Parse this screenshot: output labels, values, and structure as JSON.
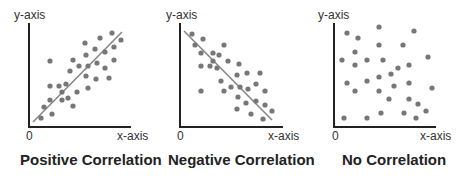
{
  "colors": {
    "axis": "#222222",
    "dot": "#777777",
    "line": "#888888",
    "text": "#222222"
  },
  "chart_data": [
    {
      "type": "scatter",
      "title": "Positive Correlation",
      "xlabel": "x-axis",
      "ylabel": "y-axis",
      "origin_label": "0",
      "trend": "positive",
      "frame": {
        "x0": 29,
        "y0": 127,
        "x1": 131,
        "ytop": 23
      },
      "trendline": [
        [
          33,
          122
        ],
        [
          122,
          32
        ]
      ],
      "points": [
        [
          50,
          61
        ],
        [
          85,
          43
        ],
        [
          100,
          38
        ],
        [
          112,
          33
        ],
        [
          121,
          40
        ],
        [
          95,
          49
        ],
        [
          86,
          55
        ],
        [
          73,
          60
        ],
        [
          79,
          66
        ],
        [
          70,
          71
        ],
        [
          88,
          66
        ],
        [
          97,
          63
        ],
        [
          105,
          52
        ],
        [
          114,
          47
        ],
        [
          105,
          68
        ],
        [
          114,
          60
        ],
        [
          86,
          76
        ],
        [
          96,
          79
        ],
        [
          109,
          78
        ],
        [
          50,
          86
        ],
        [
          59,
          86
        ],
        [
          66,
          84
        ],
        [
          62,
          92
        ],
        [
          77,
          92
        ],
        [
          88,
          88
        ],
        [
          50,
          100
        ],
        [
          62,
          100
        ],
        [
          68,
          98
        ],
        [
          44,
          107
        ],
        [
          73,
          106
        ],
        [
          52,
          114
        ],
        [
          41,
          118
        ]
      ]
    },
    {
      "type": "scatter",
      "title": "Negative Correlation",
      "xlabel": "x-axis",
      "ylabel": "y-axis",
      "origin_label": "0",
      "trend": "negative",
      "frame": {
        "x0": 180,
        "y0": 127,
        "x1": 283,
        "ytop": 23
      },
      "trendline": [
        [
          184,
          31
        ],
        [
          272,
          120
        ]
      ],
      "points": [
        [
          192,
          34
        ],
        [
          203,
          39
        ],
        [
          195,
          45
        ],
        [
          201,
          53
        ],
        [
          224,
          45
        ],
        [
          213,
          53
        ],
        [
          219,
          55
        ],
        [
          213,
          61
        ],
        [
          228,
          61
        ],
        [
          239,
          64
        ],
        [
          201,
          66
        ],
        [
          210,
          66
        ],
        [
          217,
          68
        ],
        [
          237,
          75
        ],
        [
          247,
          73
        ],
        [
          260,
          73
        ],
        [
          221,
          81
        ],
        [
          256,
          84
        ],
        [
          231,
          87
        ],
        [
          240,
          87
        ],
        [
          248,
          89
        ],
        [
          201,
          91
        ],
        [
          224,
          91
        ],
        [
          265,
          91
        ],
        [
          238,
          97
        ],
        [
          256,
          101
        ],
        [
          246,
          103
        ],
        [
          265,
          105
        ],
        [
          237,
          109
        ],
        [
          272,
          111
        ],
        [
          251,
          114
        ],
        [
          263,
          119
        ]
      ]
    },
    {
      "type": "scatter",
      "title": "No Correlation",
      "xlabel": "x-axis",
      "ylabel": "y-axis",
      "origin_label": "0",
      "trend": "none",
      "frame": {
        "x0": 334,
        "y0": 127,
        "x1": 436,
        "ytop": 23
      },
      "trendline": null,
      "points": [
        [
          379,
          27
        ],
        [
          414,
          31
        ],
        [
          347,
          33
        ],
        [
          358,
          38
        ],
        [
          379,
          45
        ],
        [
          403,
          45
        ],
        [
          355,
          52
        ],
        [
          342,
          60
        ],
        [
          367,
          60
        ],
        [
          383,
          60
        ],
        [
          428,
          57
        ],
        [
          355,
          65
        ],
        [
          409,
          65
        ],
        [
          398,
          68
        ],
        [
          391,
          74
        ],
        [
          379,
          77
        ],
        [
          367,
          81
        ],
        [
          347,
          83
        ],
        [
          394,
          86
        ],
        [
          409,
          83
        ],
        [
          355,
          91
        ],
        [
          379,
          91
        ],
        [
          432,
          88
        ],
        [
          389,
          99
        ],
        [
          409,
          99
        ],
        [
          418,
          104
        ],
        [
          426,
          111
        ],
        [
          381,
          113
        ],
        [
          404,
          113
        ],
        [
          344,
          118
        ],
        [
          367,
          118
        ],
        [
          416,
          118
        ]
      ]
    }
  ],
  "labels": {
    "positive": {
      "title": "Positive Correlation",
      "ylabel": "y-axis",
      "xlabel": "x-axis",
      "origin": "0"
    },
    "negative": {
      "title": "Negative Correlation",
      "ylabel": "y-axis",
      "xlabel": "x-axis",
      "origin": "0"
    },
    "none": {
      "title": "No Correlation",
      "ylabel": "y-axis",
      "xlabel": "x-axis",
      "origin": "0"
    }
  }
}
